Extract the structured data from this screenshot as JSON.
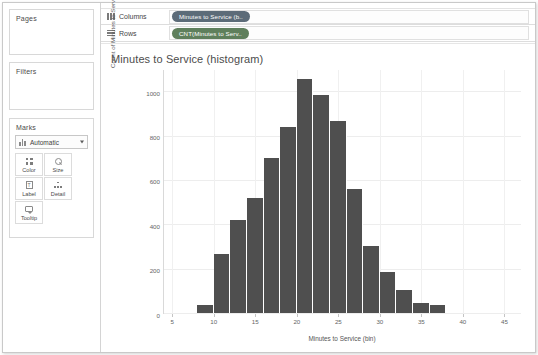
{
  "left_panel": {
    "pages_label": "Pages",
    "filters_label": "Filters",
    "marks_label": "Marks",
    "mark_type": "Automatic",
    "mark_buttons": [
      {
        "label": "Color",
        "icon": "color-squares-icon"
      },
      {
        "label": "Size",
        "icon": "size-circle-icon"
      },
      {
        "label": "Label",
        "icon": "label-text-icon"
      },
      {
        "label": "Detail",
        "icon": "detail-dots-icon"
      },
      {
        "label": "Tooltip",
        "icon": "tooltip-bubble-icon"
      }
    ]
  },
  "shelves": {
    "columns_label": "Columns",
    "rows_label": "Rows",
    "columns_pill": "Minutes to Service (b..",
    "rows_pill": "CNT(Minutes to Serv.."
  },
  "chart_data": {
    "type": "bar",
    "title": "Minutes to Service (histogram)",
    "xlabel": "Minutes to Service (bin)",
    "ylabel": "Count of Minutes to Service",
    "grid": true,
    "legend": null,
    "bar_color": "#4f4f4f",
    "bin_width": 2,
    "xlim": [
      4,
      47
    ],
    "ylim": [
      0,
      1100
    ],
    "xticks": [
      5,
      10,
      15,
      20,
      25,
      30,
      35,
      40,
      45
    ],
    "yticks": [
      0,
      200,
      400,
      600,
      800,
      1000
    ],
    "categories": [
      8,
      10,
      12,
      14,
      16,
      18,
      20,
      22,
      24,
      26,
      28,
      30,
      32,
      34,
      36
    ],
    "values": [
      35,
      265,
      420,
      520,
      700,
      840,
      1055,
      985,
      865,
      560,
      300,
      185,
      105,
      45,
      35
    ]
  }
}
